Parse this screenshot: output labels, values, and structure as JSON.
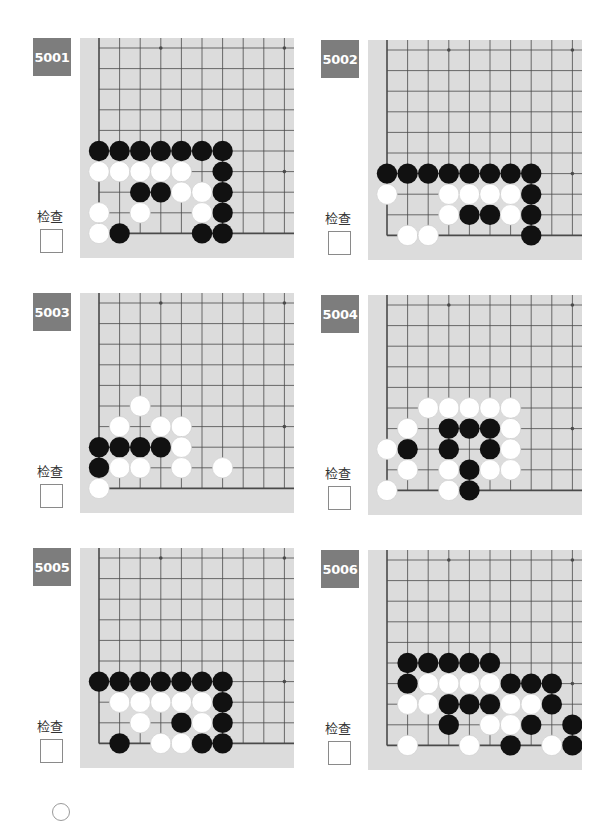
{
  "check_label": "检查",
  "colors": {
    "badge": "#7d7d7d",
    "board": "#dcdcdc",
    "line": "#4a4a4a",
    "black": "#111111",
    "white": "#ffffff"
  },
  "problems": [
    {
      "id": "5001",
      "black": [
        [
          0,
          5
        ],
        [
          1,
          5
        ],
        [
          2,
          5
        ],
        [
          3,
          5
        ],
        [
          4,
          5
        ],
        [
          5,
          5
        ],
        [
          6,
          5
        ],
        [
          6,
          6
        ],
        [
          2,
          7
        ],
        [
          3,
          7
        ],
        [
          6,
          7
        ],
        [
          6,
          8
        ],
        [
          1,
          9
        ],
        [
          5,
          9
        ],
        [
          6,
          9
        ]
      ],
      "white": [
        [
          0,
          6
        ],
        [
          1,
          6
        ],
        [
          2,
          6
        ],
        [
          3,
          6
        ],
        [
          4,
          6
        ],
        [
          4,
          7
        ],
        [
          5,
          7
        ],
        [
          0,
          8
        ],
        [
          2,
          8
        ],
        [
          5,
          8
        ],
        [
          0,
          9
        ]
      ]
    },
    {
      "id": "5002",
      "black": [
        [
          0,
          6
        ],
        [
          1,
          6
        ],
        [
          2,
          6
        ],
        [
          3,
          6
        ],
        [
          4,
          6
        ],
        [
          5,
          6
        ],
        [
          6,
          6
        ],
        [
          7,
          6
        ],
        [
          7,
          7
        ],
        [
          4,
          8
        ],
        [
          5,
          8
        ],
        [
          7,
          8
        ],
        [
          7,
          9
        ]
      ],
      "white": [
        [
          0,
          7
        ],
        [
          3,
          7
        ],
        [
          4,
          7
        ],
        [
          5,
          7
        ],
        [
          6,
          7
        ],
        [
          3,
          8
        ],
        [
          6,
          8
        ],
        [
          1,
          9
        ],
        [
          2,
          9
        ]
      ]
    },
    {
      "id": "5003",
      "black": [
        [
          0,
          7
        ],
        [
          1,
          7
        ],
        [
          2,
          7
        ],
        [
          3,
          7
        ],
        [
          0,
          8
        ]
      ],
      "white": [
        [
          2,
          5
        ],
        [
          1,
          6
        ],
        [
          3,
          6
        ],
        [
          4,
          6
        ],
        [
          4,
          7
        ],
        [
          1,
          8
        ],
        [
          2,
          8
        ],
        [
          4,
          8
        ],
        [
          6,
          8
        ],
        [
          0,
          9
        ]
      ]
    },
    {
      "id": "5004",
      "black": [
        [
          3,
          6
        ],
        [
          4,
          6
        ],
        [
          5,
          6
        ],
        [
          1,
          7
        ],
        [
          3,
          7
        ],
        [
          5,
          7
        ],
        [
          4,
          8
        ],
        [
          4,
          9
        ]
      ],
      "white": [
        [
          2,
          5
        ],
        [
          3,
          5
        ],
        [
          4,
          5
        ],
        [
          5,
          5
        ],
        [
          6,
          5
        ],
        [
          1,
          6
        ],
        [
          6,
          6
        ],
        [
          0,
          7
        ],
        [
          6,
          7
        ],
        [
          1,
          8
        ],
        [
          3,
          8
        ],
        [
          5,
          8
        ],
        [
          6,
          8
        ],
        [
          0,
          9
        ],
        [
          3,
          9
        ]
      ]
    },
    {
      "id": "5005",
      "black": [
        [
          0,
          6
        ],
        [
          1,
          6
        ],
        [
          2,
          6
        ],
        [
          3,
          6
        ],
        [
          4,
          6
        ],
        [
          5,
          6
        ],
        [
          6,
          6
        ],
        [
          6,
          7
        ],
        [
          4,
          8
        ],
        [
          6,
          8
        ],
        [
          1,
          9
        ],
        [
          5,
          9
        ],
        [
          6,
          9
        ]
      ],
      "white": [
        [
          1,
          7
        ],
        [
          2,
          7
        ],
        [
          3,
          7
        ],
        [
          4,
          7
        ],
        [
          5,
          7
        ],
        [
          2,
          8
        ],
        [
          5,
          8
        ],
        [
          3,
          9
        ],
        [
          4,
          9
        ]
      ]
    },
    {
      "id": "5006",
      "black": [
        [
          1,
          5
        ],
        [
          2,
          5
        ],
        [
          3,
          5
        ],
        [
          4,
          5
        ],
        [
          5,
          5
        ],
        [
          1,
          6
        ],
        [
          6,
          6
        ],
        [
          7,
          6
        ],
        [
          8,
          6
        ],
        [
          3,
          7
        ],
        [
          4,
          7
        ],
        [
          5,
          7
        ],
        [
          8,
          7
        ],
        [
          3,
          8
        ],
        [
          7,
          8
        ],
        [
          9,
          8
        ],
        [
          6,
          9
        ],
        [
          9,
          9
        ]
      ],
      "white": [
        [
          2,
          6
        ],
        [
          3,
          6
        ],
        [
          4,
          6
        ],
        [
          5,
          6
        ],
        [
          1,
          7
        ],
        [
          2,
          7
        ],
        [
          6,
          7
        ],
        [
          7,
          7
        ],
        [
          5,
          8
        ],
        [
          6,
          8
        ],
        [
          1,
          9
        ],
        [
          4,
          9
        ],
        [
          8,
          9
        ]
      ]
    }
  ]
}
